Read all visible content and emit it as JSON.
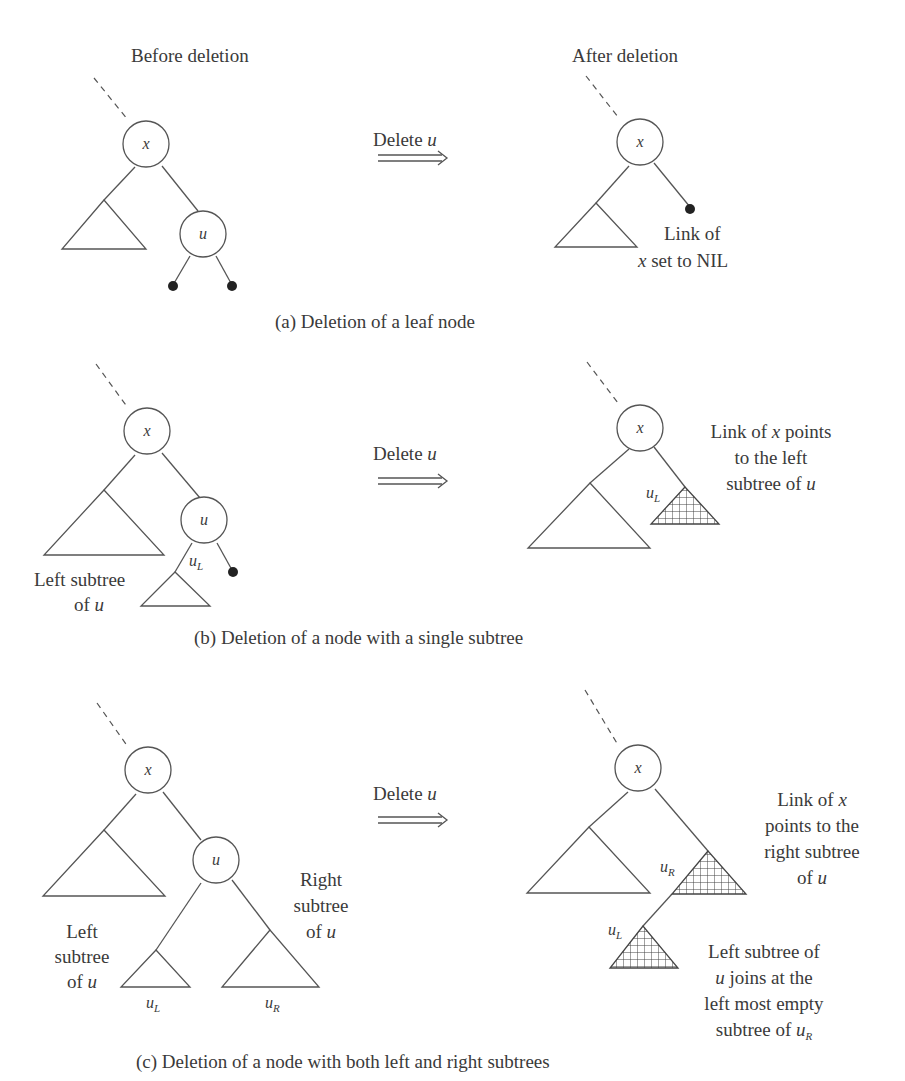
{
  "panels": [
    {
      "id": "a",
      "caption": "(a) Deletion of a leaf node",
      "before_title": "Before deletion",
      "after_title": "After deletion",
      "arrow_label_prefix": "Delete ",
      "arrow_label_var": "u",
      "before": {
        "root": "x",
        "deleted_node": "u"
      },
      "after": {
        "root": "x",
        "note_line1": "Link of",
        "note_line2_var": "x",
        "note_line2_rest": " set to NIL"
      }
    },
    {
      "id": "b",
      "caption": "(b) Deletion of a node with a single subtree",
      "arrow_label_prefix": "Delete ",
      "arrow_label_var": "u",
      "before": {
        "root": "x",
        "deleted_node": "u",
        "subtree_label": "u",
        "subtree_sub": "L",
        "left_label_line1": "Left subtree",
        "left_label_line2_pre": "of ",
        "left_label_line2_var": "u"
      },
      "after": {
        "root": "x",
        "subtree_label": "u",
        "subtree_sub": "L",
        "note_line1_pre": "Link of ",
        "note_line1_var": "x",
        "note_line1_post": " points",
        "note_line2": "to the left",
        "note_line3_pre": "subtree of ",
        "note_line3_var": "u"
      }
    },
    {
      "id": "c",
      "caption": "(c) Deletion of a node with both left and right subtrees",
      "arrow_label_prefix": "Delete ",
      "arrow_label_var": "u",
      "before": {
        "root": "x",
        "deleted_node": "u",
        "left_sub_label": "u",
        "left_sub_sub": "L",
        "right_sub_label": "u",
        "right_sub_sub": "R",
        "left_label_line1": "Left",
        "left_label_line2": "subtree",
        "left_label_line3_pre": "of ",
        "left_label_line3_var": "u",
        "right_label_line1": "Right",
        "right_label_line2": "subtree",
        "right_label_line3_pre": "of ",
        "right_label_line3_var": "u"
      },
      "after": {
        "root": "x",
        "right_sub_label": "u",
        "right_sub_sub": "R",
        "left_sub_label": "u",
        "left_sub_sub": "L",
        "note1_line1_pre": "Link of ",
        "note1_line1_var": "x",
        "note1_line2": "points to the",
        "note1_line3": "right subtree",
        "note1_line4_pre": "of ",
        "note1_line4_var": "u",
        "note2_line1": "Left subtree of",
        "note2_line2_var": "u",
        "note2_line2_rest": " joins at the",
        "note2_line3": "left most empty",
        "note2_line4_pre": "subtree of ",
        "note2_line4_var": "u",
        "note2_line4_sub": "R"
      }
    }
  ]
}
